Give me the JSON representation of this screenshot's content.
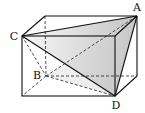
{
  "diagram": {
    "type": "rectangular-prism-with-inscribed-tetrahedron",
    "vertices": {
      "front_top_left": {
        "x": 22,
        "y": 36
      },
      "front_top_right": {
        "x": 115,
        "y": 36
      },
      "front_bottom_left": {
        "x": 22,
        "y": 96
      },
      "front_bottom_right": {
        "x": 115,
        "y": 96
      },
      "back_top_left": {
        "x": 45,
        "y": 16
      },
      "back_top_right": {
        "x": 137,
        "y": 16
      },
      "back_bottom_left": {
        "x": 46,
        "y": 76
      },
      "back_bottom_right": {
        "x": 137,
        "y": 76
      }
    },
    "labels": {
      "A": {
        "text": "A",
        "x": 137,
        "y": 7
      },
      "B": {
        "text": "B",
        "x": 37,
        "y": 75
      },
      "C": {
        "text": "C",
        "x": 14,
        "y": 36
      },
      "D": {
        "text": "D",
        "x": 116,
        "y": 105
      }
    },
    "label_points": {
      "A": "back_top_right",
      "B": "back_bottom_left",
      "C": "front_top_left",
      "D": "front_bottom_right"
    },
    "colors": {
      "stroke": "#111111",
      "shade_light": "#f4f4f4",
      "shade_dark": "#c8c8c8"
    }
  }
}
